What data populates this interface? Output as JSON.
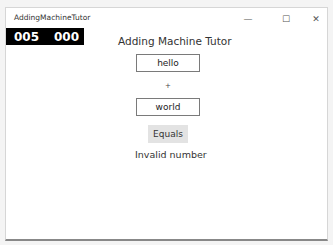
{
  "window": {
    "title": "AddingMachineTutor",
    "controls": {
      "minimize": "—",
      "maximize": "☐",
      "close": "✕"
    }
  },
  "counter": {
    "left": "005",
    "right": "000"
  },
  "main": {
    "heading": "Adding Machine Tutor",
    "first_input": "hello",
    "operator": "+",
    "second_input": "world",
    "equals_label": "Equals",
    "result": "Invalid number"
  }
}
